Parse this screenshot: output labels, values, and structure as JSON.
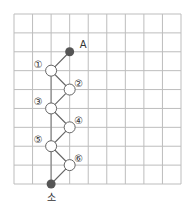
{
  "diagram": {
    "grid": {
      "cols": 9,
      "rows": 9,
      "left": 14,
      "top": 14,
      "right": 181,
      "bottom": 184,
      "line_color": "#bdbdbd"
    },
    "start_point": {
      "label": "A",
      "col": 3,
      "row": 2
    },
    "end_point": {
      "label": "소",
      "col": 2,
      "row": 9
    },
    "nodes": [
      {
        "label": "①",
        "col": 2,
        "row": 3
      },
      {
        "label": "②",
        "col": 3,
        "row": 4
      },
      {
        "label": "③",
        "col": 2,
        "row": 5
      },
      {
        "label": "④",
        "col": 3,
        "row": 6
      },
      {
        "label": "⑤",
        "col": 2,
        "row": 7
      },
      {
        "label": "⑥",
        "col": 3,
        "row": 8
      }
    ],
    "colors": {
      "filled_point": "#555555",
      "path": "#666666",
      "open_node_fill": "#ffffff",
      "open_node_stroke": "#666666"
    }
  }
}
